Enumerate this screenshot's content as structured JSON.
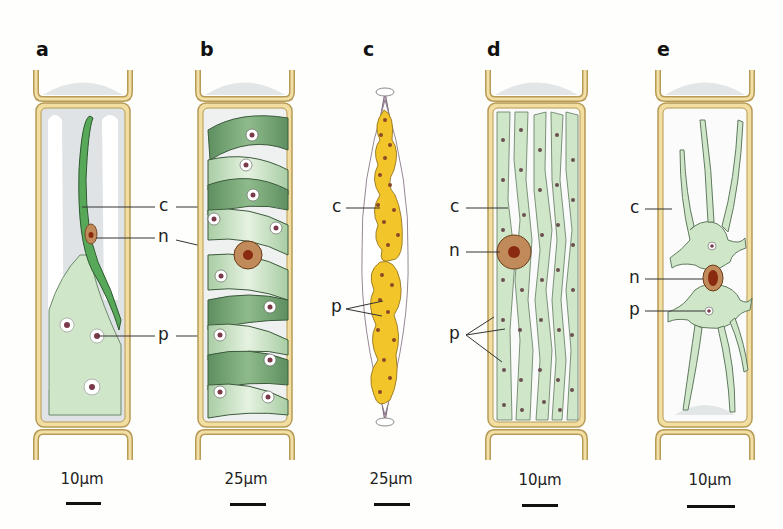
{
  "figure": {
    "panels": [
      {
        "letter": "a",
        "scale_label": "10µm",
        "labels": {
          "c": "c",
          "n": "n",
          "p": "p"
        }
      },
      {
        "letter": "b",
        "scale_label": "25µm"
      },
      {
        "letter": "c",
        "scale_label": "25µm",
        "labels": {
          "c": "c",
          "p": "p"
        }
      },
      {
        "letter": "d",
        "scale_label": "10µm",
        "labels": {
          "c": "c",
          "n": "n",
          "p": "p"
        }
      },
      {
        "letter": "e",
        "scale_label": "10µm",
        "labels": {
          "c": "c",
          "n": "n",
          "p": "p"
        }
      }
    ],
    "colors": {
      "cell_wall": "#e8d39a",
      "cell_wall_stroke": "#b79a55",
      "chloroplast_green": "#cfe6c8",
      "chloroplast_dark": "#6aa36a",
      "band_green": "#58a85a",
      "diatom_yellow": "#f2c52a",
      "diatom_frustule": "#c9aec4",
      "nucleus": "#c08a5a",
      "nucleolus": "#8a2a10",
      "pyrenoid": "#7a3a4a"
    }
  }
}
